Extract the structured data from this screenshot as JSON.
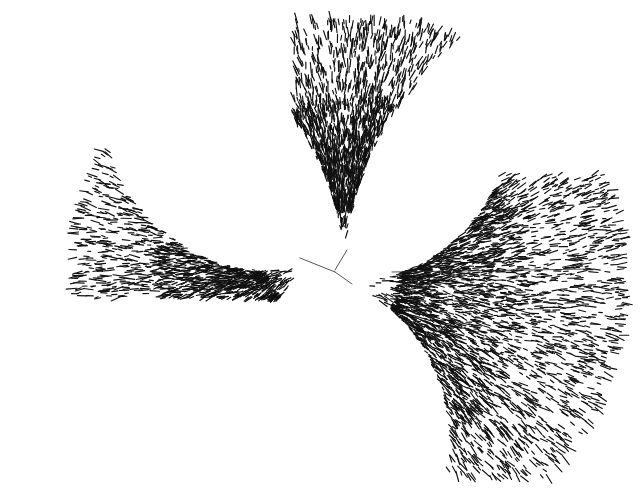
{
  "figure": {
    "kind": "unrooted-radial-phylogenetic-tree",
    "title": "",
    "caption": "",
    "width": 644,
    "height": 499,
    "background_color": "#ffffff",
    "ink_color": "#111111",
    "has_axes": false,
    "has_legend": false,
    "has_text_labels": false,
    "tip_label_text": ""
  },
  "chart_data": {
    "type": "scatter",
    "title": "",
    "xlabel": "",
    "ylabel": "",
    "xlim": [
      0,
      644
    ],
    "ylim": [
      0,
      499
    ],
    "grid": false,
    "legend_position": "none",
    "root": {
      "x": 335,
      "y": 270
    },
    "total_tips": 5400,
    "series": [
      {
        "name": "clade-left",
        "tip_count": 1850,
        "origin": {
          "x": 313,
          "y": 262
        },
        "angle_start_deg": 150,
        "angle_end_deg": 268,
        "radius_min": 20,
        "radius_max": 238,
        "bbox": [
          42,
          45,
          325,
          292
        ],
        "seam_angles_deg": [
          206,
          233
        ],
        "density_bias": 0.55
      },
      {
        "name": "clade-top",
        "tip_count": 1250,
        "origin": {
          "x": 345,
          "y": 258
        },
        "angle_start_deg": 62,
        "angle_end_deg": 120,
        "radius_min": 18,
        "radius_max": 245,
        "bbox": [
          300,
          27,
          500,
          266
        ],
        "seam_angles_deg": [
          96
        ],
        "density_bias": 0.5
      },
      {
        "name": "clade-bottom-right",
        "tip_count": 2300,
        "origin": {
          "x": 345,
          "y": 282
        },
        "angle_start_deg": -74,
        "angle_end_deg": 52,
        "radius_min": 20,
        "radius_max": 280,
        "bbox": [
          336,
          180,
          618,
          470
        ],
        "seam_angles_deg": [
          2,
          -34
        ],
        "density_bias": 0.45
      }
    ],
    "internal_branches": [
      {
        "name": "root-to-left",
        "x1": 335,
        "y1": 272,
        "x2": 300,
        "y2": 258
      },
      {
        "name": "root-to-top",
        "x1": 335,
        "y1": 270,
        "x2": 347,
        "y2": 250
      },
      {
        "name": "root-to-bottom-right",
        "x1": 335,
        "y1": 272,
        "x2": 352,
        "y2": 284
      },
      {
        "name": "long-horizontal-branch",
        "x1": 392,
        "y1": 272,
        "x2": 592,
        "y2": 269
      }
    ]
  },
  "render": {
    "stroke_width": 1.15,
    "tip_len_min": 3,
    "tip_len_max": 11,
    "seed": 20240517
  }
}
